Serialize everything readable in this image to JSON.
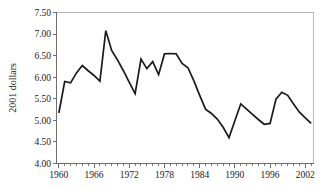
{
  "chart_data": {
    "type": "line",
    "title": "",
    "subtitle": "",
    "xlabel": "",
    "ylabel": "2001 dollars",
    "xlim": [
      1959.6,
      2003.4
    ],
    "ylim": [
      4.0,
      7.5
    ],
    "grid": false,
    "legend": null,
    "line_color": "#1a1a1a",
    "axis_color": "#6e6e6e",
    "frame_color": "#b9b9b9",
    "y_ticks": [
      4.0,
      4.5,
      5.0,
      5.5,
      6.0,
      6.5,
      7.0,
      7.5
    ],
    "y_tick_labels": [
      "4.00",
      "4.50",
      "5.00",
      "5.50",
      "6.00",
      "6.50",
      "7.00",
      "7.50"
    ],
    "x_ticks_major": [
      1960,
      1966,
      1972,
      1978,
      1984,
      1990,
      1996,
      2002
    ],
    "x_tick_labels": [
      "1960",
      "1966",
      "1972",
      "1978",
      "1984",
      "1990",
      "1996",
      "2002"
    ],
    "x_tick_interval_minor": 1,
    "x": [
      1960,
      1961,
      1962,
      1963,
      1964,
      1965,
      1966,
      1967,
      1968,
      1969,
      1970,
      1971,
      1972,
      1973,
      1974,
      1975,
      1976,
      1977,
      1978,
      1979,
      1980,
      1981,
      1982,
      1983,
      1984,
      1985,
      1986,
      1987,
      1988,
      1989,
      1990,
      1991,
      1992,
      1993,
      1994,
      1995,
      1996,
      1997,
      1998,
      1999,
      2000,
      2001,
      2002,
      2003
    ],
    "values": [
      5.17,
      5.9,
      5.87,
      6.1,
      6.27,
      6.15,
      6.04,
      5.91,
      7.08,
      6.62,
      6.4,
      6.15,
      5.88,
      5.62,
      6.42,
      6.2,
      6.36,
      6.06,
      6.54,
      6.55,
      6.54,
      6.32,
      6.22,
      5.92,
      5.58,
      5.26,
      5.16,
      5.03,
      4.84,
      4.6,
      4.99,
      5.38,
      5.26,
      5.14,
      5.02,
      4.91,
      4.93,
      5.49,
      5.65,
      5.58,
      5.38,
      5.19,
      5.06,
      4.93
    ],
    "series": [
      {
        "name": "2001 dollars",
        "values": [
          5.17,
          5.9,
          5.87,
          6.1,
          6.27,
          6.15,
          6.04,
          5.91,
          7.08,
          6.62,
          6.4,
          6.15,
          5.88,
          5.62,
          6.42,
          6.2,
          6.36,
          6.06,
          6.54,
          6.55,
          6.54,
          6.32,
          6.22,
          5.92,
          5.58,
          5.26,
          5.16,
          5.03,
          4.84,
          4.6,
          4.99,
          5.38,
          5.26,
          5.14,
          5.02,
          4.91,
          4.93,
          5.49,
          5.65,
          5.58,
          5.38,
          5.19,
          5.06,
          4.93
        ]
      }
    ],
    "annotations": {
      "max_value": 7.08,
      "max_year": 1968,
      "min_value": 4.6,
      "min_year": 1989,
      "first_value": 5.17,
      "first_year": 1960,
      "last_value": 4.93,
      "last_year": 2003
    }
  }
}
